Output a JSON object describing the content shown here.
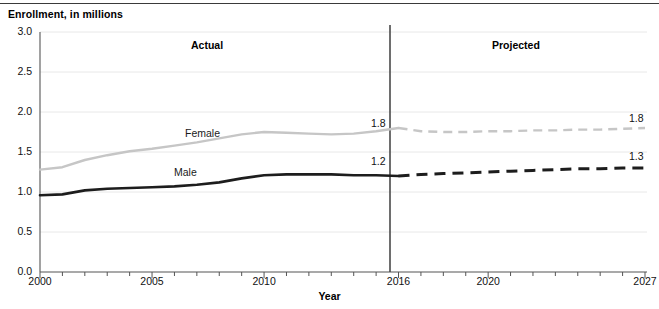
{
  "chart_data": {
    "type": "line",
    "title": "",
    "ylabel": "Enrollment, in millions",
    "xlabel": "Year",
    "ylim": [
      0.0,
      3.0
    ],
    "xlim": [
      2000,
      2027
    ],
    "grid": true,
    "legend_position": "inline-series-labels",
    "ytick_labels": [
      "0.0",
      "0.5",
      "1.0",
      "1.5",
      "2.0",
      "2.5",
      "3.0"
    ],
    "ytick_values": [
      0.0,
      0.5,
      1.0,
      1.5,
      2.0,
      2.5,
      3.0
    ],
    "xtick_labels": [
      "2000",
      "2005",
      "2010",
      "2016",
      "2020",
      "2027"
    ],
    "xtick_values": [
      2000,
      2005,
      2010,
      2016,
      2020,
      2027
    ],
    "x": [
      2000,
      2001,
      2002,
      2003,
      2004,
      2005,
      2006,
      2007,
      2008,
      2009,
      2010,
      2011,
      2012,
      2013,
      2014,
      2015,
      2016,
      2017,
      2018,
      2019,
      2020,
      2021,
      2022,
      2023,
      2024,
      2025,
      2026,
      2027
    ],
    "divider_x": 2016,
    "regions": [
      {
        "name": "actual",
        "label": "Actual",
        "from": 2000,
        "to": 2016
      },
      {
        "name": "projected",
        "label": "Projected",
        "from": 2016,
        "to": 2027
      }
    ],
    "series": [
      {
        "name": "Female",
        "label": "Female",
        "color": "#c6c6c6",
        "actual_values": [
          1.28,
          1.31,
          1.4,
          1.46,
          1.51,
          1.54,
          1.58,
          1.62,
          1.67,
          1.72,
          1.75,
          1.74,
          1.73,
          1.72,
          1.73,
          1.76,
          1.8
        ],
        "projected_values": [
          1.8,
          1.76,
          1.75,
          1.75,
          1.76,
          1.76,
          1.77,
          1.77,
          1.78,
          1.78,
          1.79,
          1.8
        ],
        "endpoint_labels": [
          {
            "at": 2016,
            "text": "1.8"
          },
          {
            "at": 2027,
            "text": "1.8"
          }
        ]
      },
      {
        "name": "Male",
        "label": "Male",
        "color": "#1d1d1d",
        "actual_values": [
          0.96,
          0.97,
          1.02,
          1.04,
          1.05,
          1.06,
          1.07,
          1.09,
          1.12,
          1.17,
          1.21,
          1.22,
          1.22,
          1.22,
          1.21,
          1.21,
          1.2
        ],
        "projected_values": [
          1.2,
          1.22,
          1.23,
          1.24,
          1.25,
          1.26,
          1.27,
          1.28,
          1.29,
          1.29,
          1.3,
          1.3
        ],
        "endpoint_labels": [
          {
            "at": 2016,
            "text": "1.2"
          },
          {
            "at": 2027,
            "text": "1.3"
          }
        ]
      }
    ]
  },
  "axis": {
    "y_title": "Enrollment, in millions",
    "x_title": "Year",
    "y_ticks": [
      "3.0",
      "2.5",
      "2.0",
      "1.5",
      "1.0",
      "0.5",
      "0.0"
    ],
    "x_ticks": [
      "2000",
      "2005",
      "2010",
      "2016",
      "2020",
      "2027"
    ]
  },
  "annotations": {
    "actual_label": "Actual",
    "projected_label": "Projected",
    "female_label": "Female",
    "male_label": "Male",
    "female_2016_value": "1.8",
    "female_2027_value": "1.8",
    "male_2016_value": "1.2",
    "male_2027_value": "1.3"
  },
  "colors": {
    "female_line": "#c6c6c6",
    "male_line": "#1d1d1d",
    "grid": "#e8e8e8",
    "axis": "#555555",
    "divider": "#4a4a4a"
  }
}
